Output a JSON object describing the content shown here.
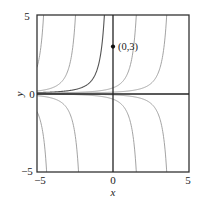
{
  "chart_data": {
    "type": "line",
    "title": "",
    "xlabel": "x",
    "ylabel": "y",
    "xlim": [
      -5,
      5
    ],
    "ylim": [
      -5,
      5
    ],
    "xticks": [
      "-5",
      "0",
      "5"
    ],
    "yticks": [
      "5",
      "0",
      "-5"
    ],
    "grid": false,
    "legend": null,
    "series": [
      {
        "name": "upper-curve-1",
        "asymptote_x": -3.9,
        "sign": 1
      },
      {
        "name": "upper-curve-2",
        "asymptote_x": -1.8,
        "sign": 1
      },
      {
        "name": "upper-curve-3 (through (0,3))",
        "asymptote_x": 0.1,
        "sign": 1,
        "highlighted": true
      },
      {
        "name": "upper-curve-4",
        "asymptote_x": 2.2,
        "sign": 1
      },
      {
        "name": "upper-curve-5",
        "asymptote_x": 4.2,
        "sign": 1
      },
      {
        "name": "lower-curve-1",
        "asymptote_x": -3.7,
        "sign": -1
      },
      {
        "name": "lower-curve-2",
        "asymptote_x": -1.6,
        "sign": -1
      },
      {
        "name": "lower-curve-3",
        "asymptote_x": 2.2,
        "sign": -1
      },
      {
        "name": "lower-curve-4",
        "asymptote_x": 4.2,
        "sign": -1
      }
    ],
    "annotations": [
      {
        "text": "(0,3)",
        "x": 0,
        "y": 3,
        "marker": "filled-circle"
      }
    ]
  },
  "labels": {
    "x_axis": "x",
    "y_axis": "y",
    "point": "(0,3)",
    "tick_x_min": "−5",
    "tick_x_zero": "0",
    "tick_x_max": "5",
    "tick_y_max": "5",
    "tick_y_zero": "0",
    "tick_y_min": "−5"
  }
}
